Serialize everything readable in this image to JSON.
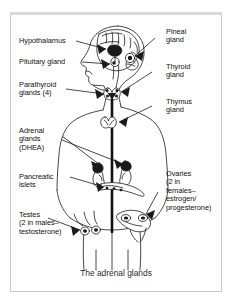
{
  "figure": {
    "caption": "The adrenal glands",
    "border_color": "#c9c9c9",
    "ink_color": "#111111",
    "background_color": "#ffffff"
  },
  "labels_left": [
    {
      "id": "hypothalamus",
      "text": "Hypothalamus"
    },
    {
      "id": "pituitary-gland",
      "text": "Pituitary gland"
    },
    {
      "id": "parathyroid-glands",
      "text": "Parathyroid\nglands (4)"
    },
    {
      "id": "adrenal-glands",
      "text": "Adrenal\nglands\n(DHEA)"
    },
    {
      "id": "pancreatic-islets",
      "text": "Pancreatic\nislets"
    },
    {
      "id": "testes",
      "text": "Testes\n(2 in males–\ntestosterone)"
    }
  ],
  "labels_right": [
    {
      "id": "pineal-gland",
      "text": "Pineal\ngland"
    },
    {
      "id": "thyroid-gland",
      "text": "Thyroid\ngland"
    },
    {
      "id": "thymus-gland",
      "text": "Thymus\ngland"
    },
    {
      "id": "ovaries",
      "text": "Ovaries\n(2 in\nfemales–\nestrogen/\nprogesterone)"
    }
  ]
}
